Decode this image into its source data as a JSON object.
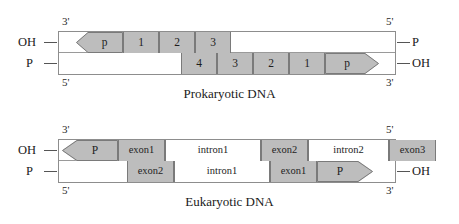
{
  "figures": [
    {
      "id": "prokaryotic",
      "caption": "Prokaryotic DNA",
      "labels": {
        "top_left_polarity": "3'",
        "top_right_polarity": "5'",
        "bottom_left_polarity": "5'",
        "bottom_right_polarity": "3'",
        "left_top_terminal": "OH",
        "left_bottom_terminal": "P",
        "right_top_terminal": "P",
        "right_bottom_terminal": "OH"
      },
      "top_strand": [
        {
          "label": "p",
          "type": "promoter-left",
          "fill": "gray",
          "x": 17,
          "w": 47
        },
        {
          "label": "1",
          "type": "gene",
          "fill": "gray",
          "x": 64,
          "w": 36
        },
        {
          "label": "2",
          "type": "gene",
          "fill": "gray",
          "x": 100,
          "w": 36
        },
        {
          "label": "3",
          "type": "gene",
          "fill": "gray",
          "x": 136,
          "w": 36
        }
      ],
      "bottom_strand": [
        {
          "label": "4",
          "type": "gene",
          "fill": "gray",
          "x": 122,
          "w": 36
        },
        {
          "label": "3",
          "type": "gene",
          "fill": "gray",
          "x": 158,
          "w": 36
        },
        {
          "label": "2",
          "type": "gene",
          "fill": "gray",
          "x": 194,
          "w": 36
        },
        {
          "label": "1",
          "type": "gene",
          "fill": "gray",
          "x": 230,
          "w": 36
        },
        {
          "label": "p",
          "type": "promoter-right",
          "fill": "gray",
          "x": 266,
          "w": 54
        }
      ]
    },
    {
      "id": "eukaryotic",
      "caption": "Eukaryotic DNA",
      "labels": {
        "top_left_polarity": "3'",
        "top_right_polarity": "5'",
        "bottom_left_polarity": "5'",
        "bottom_right_polarity": "3'",
        "left_top_terminal": "OH",
        "left_bottom_terminal": "P",
        "right_top_terminal": "P",
        "right_bottom_terminal": "OH"
      },
      "top_strand": [
        {
          "label": "P",
          "type": "promoter-left",
          "fill": "gray",
          "x": 3,
          "w": 56
        },
        {
          "label": "exon1",
          "type": "exon",
          "fill": "gray",
          "x": 59,
          "w": 47
        },
        {
          "label": "intron1",
          "type": "intron",
          "fill": "white",
          "x": 106,
          "w": 96
        },
        {
          "label": "exon2",
          "type": "exon",
          "fill": "gray",
          "x": 202,
          "w": 47
        },
        {
          "label": "intron2",
          "type": "intron",
          "fill": "white",
          "x": 249,
          "w": 81
        },
        {
          "label": "exon3",
          "type": "exon",
          "fill": "gray",
          "x": 330,
          "w": 47
        }
      ],
      "bottom_strand": [
        {
          "label": "exon2",
          "type": "exon",
          "fill": "gray",
          "x": 68,
          "w": 47
        },
        {
          "label": "intron1",
          "type": "intron",
          "fill": "white",
          "x": 115,
          "w": 96
        },
        {
          "label": "exon1",
          "type": "exon",
          "fill": "gray",
          "x": 211,
          "w": 47
        },
        {
          "label": "P",
          "type": "promoter-right",
          "fill": "gray",
          "x": 258,
          "w": 56
        }
      ]
    }
  ]
}
